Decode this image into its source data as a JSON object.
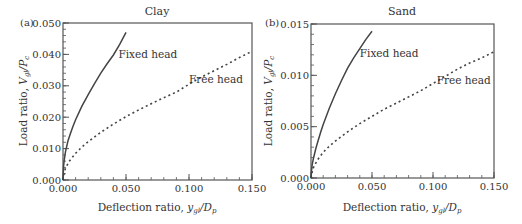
{
  "chart_data": [
    {
      "type": "line",
      "panel_tag": "(a)",
      "title": "Clay",
      "xlabel_main": "Deflection ratio, ",
      "xlabel_var": "y",
      "xlabel_sub": "gl",
      "xlabel_den": "/D",
      "xlabel_den_sub": "p",
      "ylabel_main": "Load ratio, ",
      "ylabel_var": "V",
      "ylabel_sub": "gl",
      "ylabel_den": "/P",
      "ylabel_den_sub": "c",
      "xlim": [
        0,
        0.15
      ],
      "ylim": [
        0,
        0.05
      ],
      "xticks": [
        "0.000",
        "0.050",
        "0.100",
        "0.150"
      ],
      "xtick_values": [
        0,
        0.05,
        0.1,
        0.15
      ],
      "yticks": [
        "0.000",
        "0.010",
        "0.020",
        "0.030",
        "0.040",
        "0.050"
      ],
      "ytick_values": [
        0,
        0.01,
        0.02,
        0.03,
        0.04,
        0.05
      ],
      "x_minor_step": 0.01,
      "y_minor_step": 0.002,
      "series": [
        {
          "name": "Fixed head",
          "style": "solid",
          "label_at": [
            0.044,
            0.039
          ],
          "x": [
            0,
            0.0005,
            0.001,
            0.002,
            0.004,
            0.006,
            0.008,
            0.01,
            0.015,
            0.02,
            0.025,
            0.03,
            0.035,
            0.04,
            0.045,
            0.05
          ],
          "y": [
            0,
            0.0045,
            0.0065,
            0.009,
            0.0125,
            0.015,
            0.0172,
            0.0192,
            0.0235,
            0.0272,
            0.0307,
            0.034,
            0.037,
            0.0398,
            0.0432,
            0.047
          ]
        },
        {
          "name": "Free head",
          "style": "dashed",
          "label_at": [
            0.1,
            0.031
          ],
          "x": [
            0,
            0.001,
            0.002,
            0.005,
            0.01,
            0.015,
            0.02,
            0.03,
            0.04,
            0.05,
            0.06,
            0.07,
            0.08,
            0.09,
            0.1,
            0.11,
            0.12,
            0.13,
            0.14,
            0.15
          ],
          "y": [
            0,
            0.0025,
            0.0038,
            0.006,
            0.0085,
            0.0105,
            0.0122,
            0.0152,
            0.0178,
            0.0202,
            0.0223,
            0.0243,
            0.0262,
            0.028,
            0.0305,
            0.0328,
            0.0348,
            0.0368,
            0.039,
            0.041
          ]
        }
      ]
    },
    {
      "type": "line",
      "panel_tag": "(b)",
      "title": "Sand",
      "xlabel_main": "Deflection ratio, ",
      "xlabel_var": "y",
      "xlabel_sub": "gl",
      "xlabel_den": "/D",
      "xlabel_den_sub": "p",
      "ylabel_main": "Load ratio, ",
      "ylabel_var": "V",
      "ylabel_sub": "gl",
      "ylabel_den": "/P",
      "ylabel_den_sub": "c",
      "xlim": [
        0,
        0.15
      ],
      "ylim": [
        0,
        0.015
      ],
      "xticks": [
        "0.000",
        "0.050",
        "0.100",
        "0.150"
      ],
      "xtick_values": [
        0,
        0.05,
        0.1,
        0.15
      ],
      "yticks": [
        "0.000",
        "0.005",
        "0.010",
        "0.015"
      ],
      "ytick_values": [
        0,
        0.005,
        0.01,
        0.015
      ],
      "x_minor_step": 0.01,
      "y_minor_step": 0.001,
      "series": [
        {
          "name": "Fixed head",
          "style": "solid",
          "label_at": [
            0.04,
            0.0118
          ],
          "x": [
            0,
            0.0005,
            0.001,
            0.002,
            0.004,
            0.006,
            0.008,
            0.01,
            0.015,
            0.02,
            0.025,
            0.03,
            0.035,
            0.04,
            0.045,
            0.05
          ],
          "y": [
            0,
            0.0008,
            0.0013,
            0.0019,
            0.0029,
            0.0037,
            0.0045,
            0.0052,
            0.0068,
            0.0082,
            0.0095,
            0.0107,
            0.0117,
            0.0126,
            0.0135,
            0.0143
          ]
        },
        {
          "name": "Free head",
          "style": "dashed",
          "label_at": [
            0.103,
            0.0092
          ],
          "x": [
            0,
            0.001,
            0.002,
            0.005,
            0.01,
            0.015,
            0.02,
            0.03,
            0.04,
            0.05,
            0.06,
            0.07,
            0.08,
            0.09,
            0.1,
            0.11,
            0.12,
            0.13,
            0.14,
            0.15
          ],
          "y": [
            0,
            0.0006,
            0.001,
            0.0017,
            0.0025,
            0.0031,
            0.0036,
            0.0045,
            0.0053,
            0.006,
            0.0067,
            0.0073,
            0.0079,
            0.0085,
            0.0092,
            0.0099,
            0.0106,
            0.0112,
            0.0117,
            0.0123
          ]
        }
      ]
    }
  ]
}
